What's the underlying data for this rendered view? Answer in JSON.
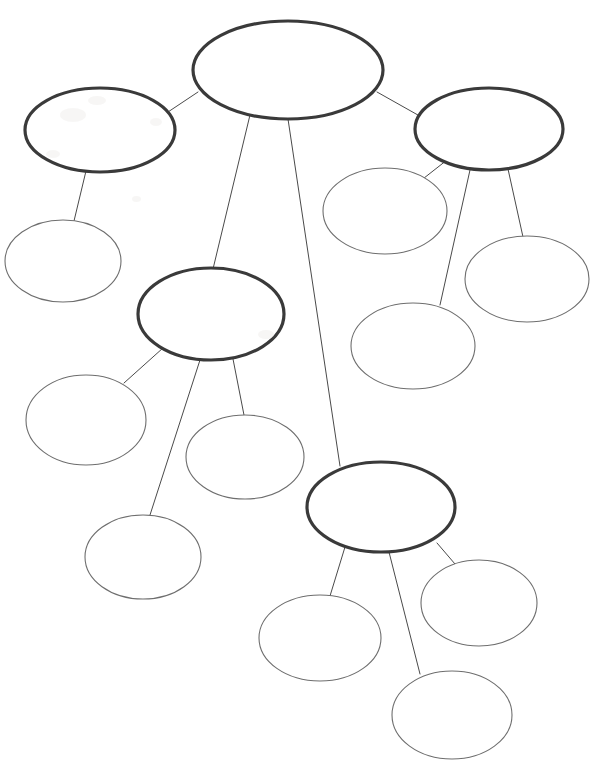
{
  "document": {
    "title": "Concept Map Worksheet",
    "kind": "blank-mind-map",
    "width": 594,
    "height": 778,
    "background_color": "#ffffff"
  },
  "style": {
    "root_stroke_color": "#3a3a3a",
    "branch_stroke_color": "#3a3a3a",
    "leaf_stroke_color": "#6e6e6e",
    "edge_stroke_color": "#4a4a4a",
    "node_fill_color": "#ffffff",
    "root_stroke_width": 3.2,
    "branch_stroke_width": 3.2,
    "leaf_stroke_width": 1.1,
    "edge_stroke_width": 1
  },
  "nodes": [
    {
      "id": "root",
      "role": "root",
      "label": "",
      "cx": 288,
      "cy": 70,
      "rx": 95,
      "ry": 49
    },
    {
      "id": "b1",
      "role": "branch",
      "label": "",
      "cx": 100,
      "cy": 130,
      "rx": 75,
      "ry": 42
    },
    {
      "id": "b1c1",
      "role": "leaf",
      "label": "",
      "cx": 63,
      "cy": 261,
      "rx": 58,
      "ry": 41
    },
    {
      "id": "b2",
      "role": "branch",
      "label": "",
      "cx": 489,
      "cy": 129,
      "rx": 74,
      "ry": 41
    },
    {
      "id": "b2c1",
      "role": "leaf",
      "label": "",
      "cx": 385,
      "cy": 211,
      "rx": 62,
      "ry": 43
    },
    {
      "id": "b2c2",
      "role": "leaf",
      "label": "",
      "cx": 413,
      "cy": 346,
      "rx": 62,
      "ry": 43
    },
    {
      "id": "b2c3",
      "role": "leaf",
      "label": "",
      "cx": 527,
      "cy": 279,
      "rx": 62,
      "ry": 43
    },
    {
      "id": "b3",
      "role": "branch",
      "label": "",
      "cx": 211,
      "cy": 314,
      "rx": 73,
      "ry": 46
    },
    {
      "id": "b3c1",
      "role": "leaf",
      "label": "",
      "cx": 86,
      "cy": 420,
      "rx": 60,
      "ry": 45
    },
    {
      "id": "b3c2",
      "role": "leaf",
      "label": "",
      "cx": 245,
      "cy": 457,
      "rx": 59,
      "ry": 42
    },
    {
      "id": "b3c3",
      "role": "leaf",
      "label": "",
      "cx": 143,
      "cy": 557,
      "rx": 58,
      "ry": 42
    },
    {
      "id": "b4",
      "role": "branch",
      "label": "",
      "cx": 381,
      "cy": 507,
      "rx": 74,
      "ry": 45
    },
    {
      "id": "b4c1",
      "role": "leaf",
      "label": "",
      "cx": 320,
      "cy": 638,
      "rx": 61,
      "ry": 43
    },
    {
      "id": "b4c2",
      "role": "leaf",
      "label": "",
      "cx": 479,
      "cy": 603,
      "rx": 58,
      "ry": 43
    },
    {
      "id": "b4c3",
      "role": "leaf",
      "label": "",
      "cx": 452,
      "cy": 715,
      "rx": 60,
      "ry": 44
    }
  ],
  "edges": [
    {
      "id": "e-root-b1",
      "from": "root",
      "to": "b1",
      "x1": 198,
      "y1": 92,
      "x2": 168,
      "y2": 112
    },
    {
      "id": "e-root-b2",
      "from": "root",
      "to": "b2",
      "x1": 377,
      "y1": 92,
      "x2": 425,
      "y2": 119
    },
    {
      "id": "e-root-b3",
      "from": "root",
      "to": "b3",
      "x1": 250,
      "y1": 115,
      "x2": 213,
      "y2": 269
    },
    {
      "id": "e-root-b4",
      "from": "root",
      "to": "b4",
      "x1": 288,
      "y1": 119,
      "x2": 340,
      "y2": 466
    },
    {
      "id": "e-b1-c1",
      "from": "b1",
      "to": "b1c1",
      "x1": 86,
      "y1": 171,
      "x2": 74,
      "y2": 221
    },
    {
      "id": "e-b2-c1",
      "from": "b2",
      "to": "b2c1",
      "x1": 447,
      "y1": 160,
      "x2": 419,
      "y2": 182
    },
    {
      "id": "e-b2-c2",
      "from": "b2",
      "to": "b2c2",
      "x1": 470,
      "y1": 170,
      "x2": 440,
      "y2": 305
    },
    {
      "id": "e-b2-c3",
      "from": "b2",
      "to": "b2c3",
      "x1": 508,
      "y1": 169,
      "x2": 523,
      "y2": 237
    },
    {
      "id": "e-b3-c1",
      "from": "b3",
      "to": "b3c1",
      "x1": 163,
      "y1": 348,
      "x2": 124,
      "y2": 383
    },
    {
      "id": "e-b3-c2",
      "from": "b3",
      "to": "b3c2",
      "x1": 233,
      "y1": 359,
      "x2": 244,
      "y2": 415
    },
    {
      "id": "e-b3-c3",
      "from": "b3",
      "to": "b3c3",
      "x1": 200,
      "y1": 360,
      "x2": 150,
      "y2": 515
    },
    {
      "id": "e-b4-c1",
      "from": "b4",
      "to": "b4c1",
      "x1": 345,
      "y1": 547,
      "x2": 330,
      "y2": 596
    },
    {
      "id": "e-b4-c2",
      "from": "b4",
      "to": "b4c2",
      "x1": 437,
      "y1": 543,
      "x2": 455,
      "y2": 564
    },
    {
      "id": "e-b4-c3",
      "from": "b4",
      "to": "b4c3",
      "x1": 389,
      "y1": 552,
      "x2": 420,
      "y2": 674
    }
  ]
}
